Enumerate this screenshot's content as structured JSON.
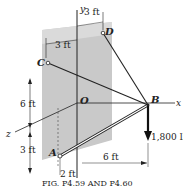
{
  "figure": {
    "caption": "FIG. P4.59 AND P4.60",
    "points": {
      "A": "A",
      "B": "B",
      "C": "C",
      "D": "D",
      "O": "O"
    },
    "axes": {
      "x": "x",
      "y": "y",
      "z": "z"
    },
    "dimensions": {
      "top_left": "3 ft",
      "top_right": "3 ft",
      "vertical_upper": "6 ft",
      "vertical_lower": "3 ft",
      "bottom_small": "2 ft",
      "bottom_horizontal": "6 ft"
    },
    "load": "1,800 lb",
    "colors": {
      "wall": "#c8c8c8",
      "line": "#222222"
    }
  }
}
